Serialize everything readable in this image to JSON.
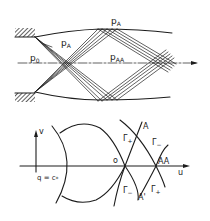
{
  "figure": {
    "top_panel": {
      "description": "Supersonic jet flow from nozzle with expansion fans and reflected characteristics",
      "labels": {
        "p_A_top": {
          "main": "p",
          "sub": "A"
        },
        "p_A_fan": {
          "main": "p",
          "sub": "A"
        },
        "p_0": {
          "main": "p",
          "sub": "0"
        },
        "p_AA": {
          "main": "p",
          "sub": "AA"
        }
      }
    },
    "bottom_panel": {
      "description": "Hodograph plane with characteristic curves",
      "axis_labels": {
        "v": "v",
        "u": "u",
        "q_eq": "q = c",
        "q_sub": "*"
      },
      "point_labels": {
        "o": "o",
        "AA": "AA",
        "A": "A",
        "A_prime": "A'"
      },
      "curve_labels": {
        "gamma_plus_upper": {
          "main": "Γ",
          "sub": "+"
        },
        "gamma_minus_upper": {
          "main": "Γ",
          "sub": "−"
        },
        "gamma_minus_lower": {
          "main": "Γ",
          "sub": "−"
        },
        "gamma_plus_lower": {
          "main": "Γ",
          "sub": "+"
        }
      }
    }
  },
  "colors": {
    "ink": "#1c1c1c",
    "paper": "#ffffff"
  }
}
